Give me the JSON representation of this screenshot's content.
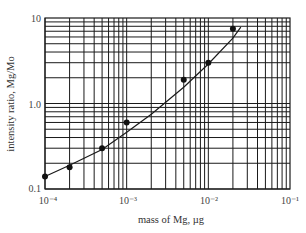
{
  "chart_data": {
    "type": "scatter",
    "title": "",
    "xlabel": "mass of Mg, µg",
    "ylabel": "intensity ratio, Mg/Mo",
    "xscale": "log",
    "yscale": "log",
    "xlim": [
      0.0001,
      0.1
    ],
    "ylim": [
      0.1,
      10
    ],
    "grid": true,
    "x_tick_labels": [
      "10⁻⁴",
      "10⁻³",
      "10⁻²",
      "10⁻¹"
    ],
    "y_tick_labels": [
      "0.1",
      "1.0",
      "10"
    ],
    "series": [
      {
        "name": "measured",
        "marker": "filled-circle",
        "x": [
          0.0001,
          0.0002,
          0.0005,
          0.001,
          0.005,
          0.01,
          0.02
        ],
        "y": [
          0.14,
          0.18,
          0.3,
          0.6,
          1.9,
          3.0,
          7.5
        ]
      },
      {
        "name": "fitted curve",
        "style": "line",
        "x": [
          0.0001,
          0.0002,
          0.0005,
          0.001,
          0.002,
          0.005,
          0.01,
          0.02,
          0.025
        ],
        "y": [
          0.14,
          0.19,
          0.29,
          0.46,
          0.75,
          1.55,
          2.9,
          5.8,
          7.8
        ]
      }
    ]
  },
  "axes": {
    "x_label": "mass of Mg, µg",
    "y_label": "intensity ratio, Mg/Mo",
    "x_ticks": [
      "10⁻⁴",
      "10⁻³",
      "10⁻²",
      "10⁻¹"
    ],
    "y_ticks": [
      "0.1",
      "1.0",
      "10"
    ]
  }
}
